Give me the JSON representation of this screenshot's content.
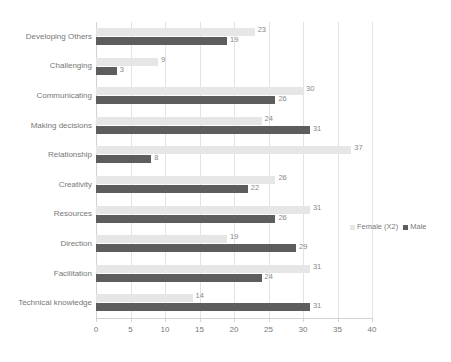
{
  "chart_data": {
    "type": "bar",
    "orientation": "horizontal",
    "title": "",
    "subtitle": "",
    "xlabel": "",
    "ylabel": "",
    "xlim": [
      0,
      40
    ],
    "xticks": [
      0,
      5,
      10,
      15,
      20,
      25,
      30,
      35,
      40
    ],
    "grid": true,
    "grid_axis": "x",
    "legend_position": "right",
    "categories": [
      "Developing Others",
      "Challenging",
      "Communicating",
      "Making decisions",
      "Relationship",
      "Creativity",
      "Resources",
      "Direction",
      "Facilitation",
      "Technical knowledge"
    ],
    "series": [
      {
        "name": "Female (X2)",
        "color": "#e6e6e6",
        "values": [
          23,
          9,
          30,
          24,
          37,
          26,
          31,
          19,
          31,
          14
        ]
      },
      {
        "name": "Male",
        "color": "#5d5d5d",
        "values": [
          19,
          3,
          26,
          31,
          8,
          22,
          26,
          29,
          24,
          31
        ]
      }
    ]
  },
  "legend": {
    "entries": [
      {
        "label": "Female (X2)",
        "color": "#e6e6e6"
      },
      {
        "label": "Male",
        "color": "#5d5d5d"
      }
    ]
  },
  "axis": {
    "x_tick_labels": [
      "0",
      "5",
      "10",
      "15",
      "20",
      "25",
      "30",
      "35",
      "40"
    ]
  }
}
